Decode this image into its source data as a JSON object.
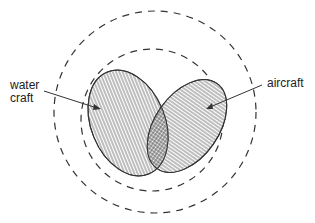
{
  "diagram": {
    "type": "euler-venn",
    "labels": {
      "water_craft_line1": "water",
      "water_craft_line2": "craft",
      "aircraft": "aircraft"
    },
    "sets": [
      {
        "name": "water craft",
        "hatch": "vertical"
      },
      {
        "name": "aircraft",
        "hatch": "horizontal"
      },
      {
        "name": "intersection",
        "hatch": "crosshatch"
      }
    ],
    "boundaries": [
      {
        "name": "outer-universe",
        "style": "dashed circle"
      },
      {
        "name": "inner-boundary",
        "style": "dashed circle"
      }
    ],
    "colors": {
      "stroke": "#333333",
      "background": "#ffffff"
    }
  }
}
